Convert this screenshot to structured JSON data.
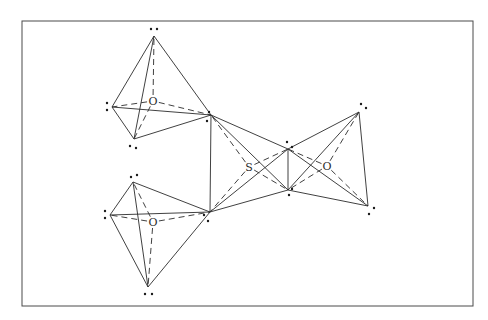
{
  "figure": {
    "frame": {
      "x": 22,
      "y": 21,
      "w": 451,
      "h": 285
    },
    "labels": [
      {
        "id": "O1",
        "text": "O",
        "x": 153,
        "y": 105
      },
      {
        "id": "O2",
        "text": "O",
        "x": 153,
        "y": 226
      },
      {
        "id": "S",
        "text": "S",
        "x": 249,
        "y": 171
      },
      {
        "id": "O3",
        "text": "O",
        "x": 327,
        "y": 170
      }
    ],
    "vertices": {
      "a1": [
        154,
        36
      ],
      "b1": [
        112,
        107
      ],
      "c1": [
        134,
        139
      ],
      "A": [
        211,
        115
      ],
      "B": [
        210,
        212
      ],
      "a2": [
        133,
        182
      ],
      "b2": [
        110,
        215
      ],
      "c2": [
        148,
        287
      ],
      "C": [
        288,
        149
      ],
      "D": [
        288,
        190
      ],
      "E": [
        359,
        112
      ],
      "F": [
        368,
        206
      ]
    },
    "centers": {
      "O1": [
        153,
        101
      ],
      "O2": [
        153,
        222
      ],
      "S": [
        249,
        167
      ],
      "O3": [
        327,
        166
      ]
    },
    "solid_edges": [
      [
        "a1",
        "b1"
      ],
      [
        "a1",
        "c1"
      ],
      [
        "a1",
        "A"
      ],
      [
        "b1",
        "c1"
      ],
      [
        "b1",
        "A"
      ],
      [
        "c1",
        "A"
      ],
      [
        "a2",
        "b2"
      ],
      [
        "a2",
        "B"
      ],
      [
        "a2",
        "c2"
      ],
      [
        "b2",
        "B"
      ],
      [
        "b2",
        "c2"
      ],
      [
        "c2",
        "B"
      ],
      [
        "A",
        "B"
      ],
      [
        "A",
        "C"
      ],
      [
        "A",
        "D"
      ],
      [
        "B",
        "C"
      ],
      [
        "B",
        "D"
      ],
      [
        "C",
        "D"
      ],
      [
        "C",
        "E"
      ],
      [
        "C",
        "F"
      ],
      [
        "D",
        "E"
      ],
      [
        "D",
        "F"
      ],
      [
        "E",
        "F"
      ]
    ],
    "dashed_edges": [
      [
        "O1",
        "a1"
      ],
      [
        "O1",
        "b1"
      ],
      [
        "O1",
        "c1"
      ],
      [
        "O1",
        "A"
      ],
      [
        "O2",
        "a2"
      ],
      [
        "O2",
        "b2"
      ],
      [
        "O2",
        "c2"
      ],
      [
        "O2",
        "B"
      ],
      [
        "S",
        "A"
      ],
      [
        "S",
        "B"
      ],
      [
        "S",
        "C"
      ],
      [
        "S",
        "D"
      ],
      [
        "O3",
        "C"
      ],
      [
        "O3",
        "D"
      ],
      [
        "O3",
        "E"
      ],
      [
        "O3",
        "F"
      ]
    ],
    "lone_pair_dots": [
      [
        151,
        29
      ],
      [
        157,
        29
      ],
      [
        107,
        103
      ],
      [
        107,
        110
      ],
      [
        130,
        146
      ],
      [
        136,
        148
      ],
      [
        209,
        112
      ],
      [
        207,
        121
      ],
      [
        131,
        177
      ],
      [
        137,
        175
      ],
      [
        105,
        211
      ],
      [
        105,
        218
      ],
      [
        145,
        294
      ],
      [
        152,
        294
      ],
      [
        204,
        215
      ],
      [
        208,
        221
      ],
      [
        287,
        142
      ],
      [
        292,
        147
      ],
      [
        292,
        189
      ],
      [
        289,
        195
      ],
      [
        361,
        104
      ],
      [
        366,
        108
      ],
      [
        374,
        208
      ],
      [
        369,
        214
      ]
    ]
  }
}
